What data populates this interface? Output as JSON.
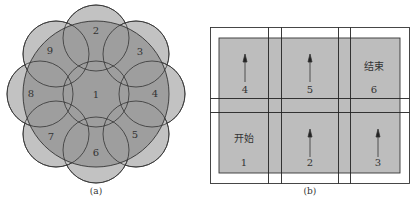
{
  "panel_a": {
    "caption": "(a)",
    "center_label": "1",
    "outer_labels": [
      "2",
      "3",
      "4",
      "5",
      "6",
      "7",
      "8",
      "9"
    ],
    "colors": {
      "fill_outer": "#b9b9b9",
      "fill_big": "#9a9a9a",
      "stroke": "#333333"
    }
  },
  "panel_b": {
    "caption": "(b)",
    "cells": [
      {
        "id": "1",
        "text": "开始",
        "arrow": false
      },
      {
        "id": "2",
        "text": "",
        "arrow": true
      },
      {
        "id": "3",
        "text": "",
        "arrow": true
      },
      {
        "id": "4",
        "text": "",
        "arrow": true
      },
      {
        "id": "5",
        "text": "",
        "arrow": true
      },
      {
        "id": "6",
        "text": "结束",
        "arrow": false
      }
    ],
    "colors": {
      "fill": "#bdbdbd",
      "stroke": "#222222"
    }
  }
}
